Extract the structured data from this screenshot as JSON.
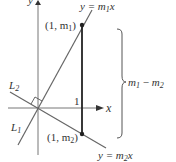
{
  "diagram": {
    "lines": {
      "line1_label": "L",
      "line1_sub": "1",
      "line2_label": "L",
      "line2_sub": "2",
      "line1_equation_prefix": "y = m",
      "line1_equation_sub": "1",
      "line1_equation_suffix": "x",
      "line2_equation_prefix": "y = m",
      "line2_equation_sub": "2",
      "line2_equation_suffix": "x"
    },
    "points": {
      "upper_prefix": "(1, m",
      "upper_sub": "1",
      "upper_suffix": ")",
      "lower_prefix": "(1, m",
      "lower_sub": "2",
      "lower_suffix": ")"
    },
    "axes": {
      "x_label": "x",
      "y_label": "y",
      "tick_label": "1"
    },
    "brace": {
      "label_a": "m",
      "label_a_sub": "1",
      "minus": " − ",
      "label_b": "m",
      "label_b_sub": "2"
    },
    "colors": {
      "line": "#666666",
      "segment": "#222222",
      "text": "#333333"
    }
  }
}
